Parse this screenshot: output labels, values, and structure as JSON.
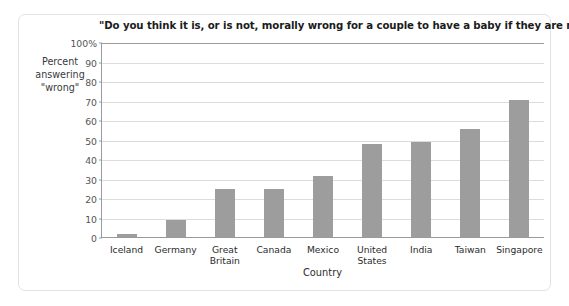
{
  "figure": {
    "title": "\"Do you think it is, or is not, morally wrong for a couple to have a baby if they are not married?\"",
    "y_axis_title": "Percent\nanswering\n\"wrong\"",
    "y_axis_title_lines": [
      "Percent",
      "answering",
      "\"wrong\""
    ],
    "x_axis_title": "Country",
    "bar_color": "#9d9d9d",
    "gridline_color": "#dcdcdc",
    "axis_color": "#9a9a9a",
    "border_color": "#e2e2e2"
  },
  "chart_data": {
    "type": "bar",
    "title": "\"Do you think it is, or is not, morally wrong for a couple to have a baby if they are not married?\"",
    "xlabel": "Country",
    "ylabel": "Percent answering \"wrong\"",
    "categories": [
      "Iceland",
      "Germany",
      "Great Britain",
      "Canada",
      "Mexico",
      "United States",
      "India",
      "Taiwan",
      "Singapore"
    ],
    "values": [
      2,
      9,
      25,
      25,
      32,
      48,
      49,
      56,
      71
    ],
    "ylim": [
      0,
      100
    ],
    "yticks": [
      0,
      10,
      20,
      30,
      40,
      50,
      60,
      70,
      80,
      90,
      100
    ],
    "ytick_labels": [
      "0",
      "10",
      "20",
      "30",
      "40",
      "50",
      "60",
      "70",
      "80",
      "90",
      "100%"
    ],
    "grid": true,
    "legend": false
  }
}
